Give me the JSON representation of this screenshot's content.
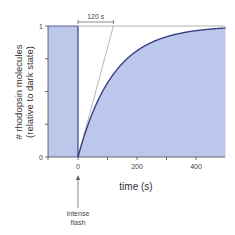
{
  "chart_data": {
    "type": "area",
    "title": "",
    "xlabel": "time (s)",
    "ylabel": "# rhodopsin molecules",
    "ylabel_sub": "(relative to dark state)",
    "xlim": [
      -100,
      500
    ],
    "ylim": [
      0,
      1
    ],
    "x_ticks": [
      -100,
      0,
      100,
      200,
      300,
      400
    ],
    "x_tick_labels": [
      "",
      "0",
      "",
      "200",
      "",
      "400"
    ],
    "y_ticks": [
      0,
      0.25,
      0.5,
      0.75,
      1
    ],
    "y_tick_labels": [
      "0",
      "",
      "",
      "",
      "1"
    ],
    "grid": false,
    "series": [
      {
        "name": "rhodopsin fraction",
        "description": "1 before flash; drops to 0 at t=0; recovers exponentially with time constant ~120 s",
        "x": [
          -100,
          0,
          0,
          50,
          100,
          150,
          200,
          250,
          300,
          350,
          400,
          450,
          500
        ],
        "values": [
          1,
          1,
          0,
          0.34,
          0.57,
          0.71,
          0.81,
          0.875,
          0.92,
          0.946,
          0.964,
          0.977,
          0.985
        ],
        "time_constant_s": 120
      }
    ],
    "annotations": [
      {
        "type": "bracket",
        "text": "120 s",
        "x_from": 0,
        "x_to": 120,
        "y": 1.05
      },
      {
        "type": "tangent-line",
        "from": [
          0,
          0
        ],
        "to": [
          120,
          1
        ]
      },
      {
        "type": "reference-line",
        "y": 1,
        "x_from": 0,
        "x_to": 500
      },
      {
        "type": "arrow",
        "text": "intense flash",
        "x": 0
      }
    ],
    "colors": {
      "fill": "#bcc8eb",
      "curve": "#3a3f86",
      "reference": "#9a9a9a",
      "axis": "#444444"
    }
  },
  "labels": {
    "xlabel": "time (s)",
    "ylabel": "# rhodopsin molecules",
    "ylabel_sub": "(relative to dark state)",
    "bracket": "120 s",
    "flash_line1": "intense",
    "flash_line2": "flash",
    "tick_0": "0",
    "tick_200": "200",
    "tick_400": "400",
    "ytick_0": "0",
    "ytick_1": "1"
  }
}
